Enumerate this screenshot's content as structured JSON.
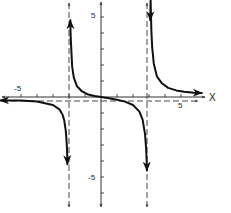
{
  "chart_data": {
    "type": "line",
    "title": "",
    "xlabel": "X",
    "ylabel": "",
    "xlim": [
      -6,
      7.5
    ],
    "ylim": [
      -6,
      6
    ],
    "grid": false,
    "legend": null,
    "x_tick_labels": [
      {
        "value": -5,
        "label": "-5"
      },
      {
        "value": 5,
        "label": "5"
      }
    ],
    "y_tick_labels": [
      {
        "value": 5,
        "label": "5"
      },
      {
        "value": -5,
        "label": "-5"
      }
    ],
    "x_ticks": [
      -5,
      -4,
      -3,
      -2,
      -1,
      0,
      1,
      2,
      3,
      4,
      5
    ],
    "y_ticks": [
      -6,
      -5,
      -4,
      -3,
      -2,
      -1,
      0,
      1,
      2,
      3,
      4,
      5
    ],
    "function_model": "y = x / ((x + 2)(x - 3))",
    "vertical_asymptotes": [
      -2,
      3
    ],
    "horizontal_asymptote": 0,
    "series": [
      {
        "name": "left-branch",
        "points": [
          [
            -6.3,
            -0.21
          ],
          [
            -5,
            -0.21
          ],
          [
            -4,
            -0.29
          ],
          [
            -3,
            -0.5
          ],
          [
            -2.6,
            -0.77
          ],
          [
            -2.4,
            -1.11
          ],
          [
            -2.3,
            -1.45
          ],
          [
            -2.2,
            -2.12
          ],
          [
            -2.15,
            -2.79
          ],
          [
            -2.12,
            -3.4
          ],
          [
            -2.1,
            -4.2
          ]
        ],
        "end_arrows": [
          "left",
          "down"
        ]
      },
      {
        "name": "middle-branch",
        "points": [
          [
            -1.92,
            4.8
          ],
          [
            -1.9,
            3.88
          ],
          [
            -1.85,
            2.83
          ],
          [
            -1.8,
            1.88
          ],
          [
            -1.7,
            1.21
          ],
          [
            -1.5,
            0.67
          ],
          [
            -1.2,
            0.36
          ],
          [
            -0.8,
            0.15
          ],
          [
            -0.4,
            0.06
          ],
          [
            0,
            0
          ],
          [
            0.5,
            -0.08
          ],
          [
            1,
            -0.17
          ],
          [
            1.5,
            -0.29
          ],
          [
            2,
            -0.5
          ],
          [
            2.4,
            -0.91
          ],
          [
            2.6,
            -1.42
          ],
          [
            2.75,
            -2.3
          ],
          [
            2.82,
            -3.2
          ],
          [
            2.86,
            -4.2
          ],
          [
            2.87,
            -4.6
          ]
        ],
        "end_arrows": [
          "up",
          "down"
        ]
      },
      {
        "name": "right-branch",
        "points": [
          [
            3.08,
            4.8
          ],
          [
            3.1,
            6.08
          ],
          [
            3.15,
            4.08
          ],
          [
            3.2,
            3.08
          ],
          [
            3.3,
            2.08
          ],
          [
            3.5,
            1.27
          ],
          [
            3.8,
            0.86
          ],
          [
            4.2,
            0.57
          ],
          [
            4.7,
            0.41
          ],
          [
            5.2,
            0.33
          ],
          [
            5.8,
            0.27
          ],
          [
            6.3,
            0.25
          ]
        ],
        "end_arrows": [
          "up",
          "right"
        ]
      }
    ]
  },
  "axes": {
    "x_label": "X",
    "x_neg_label": "-5",
    "x_pos_label": "5",
    "y_pos_label": "5",
    "y_neg_label": "-5"
  },
  "colors": {
    "ink": "#111111",
    "axis": "#333333",
    "background": "#ffffff"
  }
}
